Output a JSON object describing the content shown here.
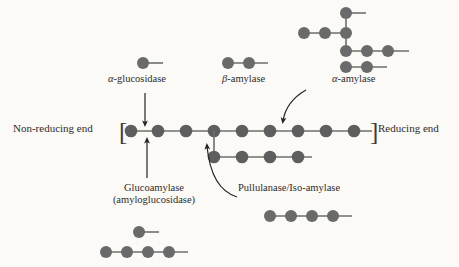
{
  "figure": {
    "type": "schematic-diagram",
    "background_color": "#fbfaf7",
    "glucose_unit_color": "#6e6e6e",
    "bond_line_color": "#6e6e6e",
    "text_color": "#2f2b29",
    "arrow_color": "#262321"
  },
  "labels": {
    "alpha_glucosidase": {
      "alpha": "α",
      "rest": "-glucosidase"
    },
    "beta_amylase": {
      "beta": "β",
      "rest": "-amylase"
    },
    "alpha_amylase": {
      "alpha": "α",
      "rest": "-amylase"
    },
    "non_reducing_end": "Non-reducing end",
    "reducing_end": "Reducing end",
    "glucoamylase_line1": "Glucoamylase",
    "glucoamylase_line2": "(amyloglucosidase)",
    "pullulanase": "Pullulanase/Iso-amylase",
    "bracket_left": "[",
    "bracket_right": "]"
  },
  "structures": {
    "main_chain": {
      "name": "amylopectin-backbone",
      "unit_count": 9,
      "unit_label": "glucose-unit",
      "has_left_bracket": true,
      "has_right_bracket": true,
      "terminal_bond_right": true
    },
    "branch_chain": {
      "name": "alpha-1-6-branch",
      "unit_count": 4,
      "attached_to_main_unit_index": 4,
      "terminal_bond_right": true
    },
    "product_alpha_glucosidase": {
      "name": "glucose",
      "unit_count": 1,
      "terminal_bond_right": true
    },
    "product_beta_amylase": {
      "name": "maltose",
      "unit_count": 2,
      "terminal_bond_right": true
    },
    "product_alpha_amylase": {
      "name": "branched-limit-dextrin",
      "rows": [
        {
          "row": "top-stub",
          "unit_count": 1
        },
        {
          "row": "upper-chain",
          "unit_count": 3
        },
        {
          "row": "middle-chain",
          "unit_count": 3
        },
        {
          "row": "lower-chain",
          "unit_count": 2
        }
      ]
    },
    "product_glucoamylase": {
      "name": "glucose-plus-linear-chain",
      "rows": [
        {
          "row": "glucose",
          "unit_count": 1
        },
        {
          "row": "linear-chain",
          "unit_count": 4
        }
      ]
    },
    "product_pullulanase": {
      "name": "debranched-linear-chain",
      "unit_count": 4
    }
  },
  "arrows": [
    {
      "name": "arrow-alpha-glucosidase",
      "from": "alpha-glucosidase-label",
      "to": "main-chain-bond-1-2",
      "direction": "down"
    },
    {
      "name": "arrow-glucoamylase",
      "from": "glucoamylase-label",
      "to": "main-chain-bond-1-2",
      "direction": "up"
    },
    {
      "name": "arrow-alpha-amylase",
      "from": "alpha-amylase-label",
      "to": "main-chain-bond-6-7",
      "direction": "curved-down"
    },
    {
      "name": "arrow-pullulanase",
      "from": "pullulanase-label",
      "to": "branch-point",
      "direction": "curved-up-left"
    }
  ]
}
